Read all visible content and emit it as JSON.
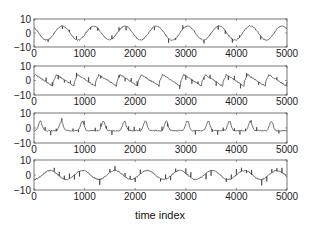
{
  "figure": {
    "xlabel": "time index",
    "background": "#ffffff",
    "line_color": "#333333",
    "axes_color": "#555555"
  },
  "chart_data": [
    {
      "type": "line",
      "title": "",
      "xlabel": "",
      "ylabel": "",
      "xlim": [
        0,
        5000
      ],
      "ylim": [
        -10,
        10
      ],
      "xticks": [
        0,
        1000,
        2000,
        3000,
        4000,
        5000
      ],
      "yticks": [
        -10,
        0,
        10
      ],
      "xtick_labels": [
        "0",
        "1000",
        "2000",
        "3000",
        "4000",
        "5000"
      ],
      "ytick_labels": [
        "-10",
        "0",
        "10"
      ],
      "grid": false,
      "description": "smooth sinusoid, amplitude ~5, ~8 cycles over 5000 samples, small spikes",
      "model": {
        "amp": 5,
        "period": 620,
        "phase": 0.35,
        "shape": "sine",
        "spike_scale": 1.6,
        "spike_every": 140
      },
      "x": [
        0,
        250,
        500,
        750,
        1000,
        1250,
        1500,
        1750,
        2000,
        2250,
        2500,
        2750,
        3000,
        3250,
        3500,
        3750,
        4000,
        4250,
        4500,
        4750,
        5000
      ],
      "values": [
        1,
        4,
        -3,
        3,
        -2,
        -4,
        4,
        -4,
        2,
        0,
        4,
        -3,
        4,
        -2,
        -4,
        4,
        -3,
        1,
        4,
        -4,
        2
      ]
    },
    {
      "type": "line",
      "title": "",
      "xlabel": "",
      "ylabel": "",
      "xlim": [
        0,
        5000
      ],
      "ylim": [
        -10,
        10
      ],
      "xticks": [
        0,
        1000,
        2000,
        3000,
        4000,
        5000
      ],
      "yticks": [
        -10,
        0,
        10
      ],
      "xtick_labels": [
        "0",
        "1000",
        "2000",
        "3000",
        "4000",
        "5000"
      ],
      "ytick_labels": [
        "-10",
        "0",
        "10"
      ],
      "grid": false,
      "description": "sawtooth-like waveform with sharp rises, amplitude ~4",
      "model": {
        "amp": 4,
        "period": 420,
        "phase": 0.1,
        "shape": "saw",
        "spike_scale": 1.8,
        "spike_every": 120
      },
      "x": [
        0,
        250,
        500,
        750,
        1000,
        1250,
        1500,
        1750,
        2000,
        2250,
        2500,
        2750,
        3000,
        3250,
        3500,
        3750,
        4000,
        4250,
        4500,
        4750,
        5000
      ],
      "values": [
        3,
        -1,
        4,
        0,
        3,
        -2,
        1,
        3,
        -1,
        5,
        -2,
        4,
        1,
        0,
        3,
        -2,
        4,
        1,
        3,
        0,
        -2
      ]
    },
    {
      "type": "line",
      "title": "",
      "xlabel": "",
      "ylabel": "",
      "xlim": [
        0,
        5000
      ],
      "ylim": [
        -10,
        10
      ],
      "xticks": [
        0,
        1000,
        2000,
        3000,
        4000,
        5000
      ],
      "yticks": [
        -10,
        0,
        10
      ],
      "xtick_labels": [
        "0",
        "1000",
        "2000",
        "3000",
        "4000",
        "5000"
      ],
      "ytick_labels": [
        "-10",
        "0",
        "10"
      ],
      "grid": false,
      "description": "peaked periodic pulses, amplitude ~4, ~12 cycles",
      "model": {
        "amp": 4,
        "period": 415,
        "phase": 0.2,
        "shape": "peak",
        "spike_scale": 1.5,
        "spike_every": 110
      },
      "x": [
        0,
        250,
        500,
        750,
        1000,
        1250,
        1500,
        1750,
        2000,
        2250,
        2500,
        2750,
        3000,
        3250,
        3500,
        3750,
        4000,
        4250,
        4500,
        4750,
        5000
      ],
      "values": [
        2,
        -2,
        4,
        -1,
        3,
        -2,
        4,
        -1,
        3,
        -1,
        4,
        -2,
        3,
        -1,
        4,
        -2,
        3,
        -1,
        4,
        -2,
        1
      ]
    },
    {
      "type": "line",
      "title": "",
      "xlabel": "time index",
      "ylabel": "",
      "xlim": [
        0,
        5000
      ],
      "ylim": [
        -10,
        10
      ],
      "xticks": [
        0,
        1000,
        2000,
        3000,
        4000,
        5000
      ],
      "yticks": [
        -10,
        0,
        10
      ],
      "xtick_labels": [
        "0",
        "1000",
        "2000",
        "3000",
        "4000",
        "5000"
      ],
      "ytick_labels": [
        "-10",
        "0",
        "10"
      ],
      "grid": false,
      "description": "slow wavy signal with downward spikes, amplitude ~3",
      "model": {
        "amp": 3,
        "period": 640,
        "phase": 0.75,
        "shape": "sine",
        "spike_scale": 2.2,
        "spike_every": 100
      },
      "x": [
        0,
        250,
        500,
        750,
        1000,
        1250,
        1500,
        1750,
        2000,
        2250,
        2500,
        2750,
        3000,
        3250,
        3500,
        3750,
        4000,
        4250,
        4500,
        4750,
        5000
      ],
      "values": [
        0,
        -3,
        3,
        -2,
        1,
        3,
        -3,
        2,
        0,
        -3,
        -2,
        -2,
        1,
        -3,
        2,
        3,
        -2,
        1,
        4,
        -2,
        2
      ]
    }
  ]
}
